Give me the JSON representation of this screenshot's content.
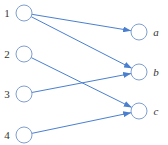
{
  "diagram": {
    "type": "bipartite-graph",
    "colors": {
      "edge": "#4a7fd0",
      "node_stroke": "#7f9fd0",
      "text": "#333333"
    },
    "left_nodes": [
      {
        "id": "1",
        "label": "1",
        "x": 24,
        "y": 13
      },
      {
        "id": "2",
        "label": "2",
        "x": 24,
        "y": 54
      },
      {
        "id": "3",
        "label": "3",
        "x": 24,
        "y": 94
      },
      {
        "id": "4",
        "label": "4",
        "x": 24,
        "y": 135
      }
    ],
    "right_nodes": [
      {
        "id": "a",
        "label": "a",
        "x": 139,
        "y": 32
      },
      {
        "id": "b",
        "label": "b",
        "x": 139,
        "y": 72
      },
      {
        "id": "c",
        "label": "c",
        "x": 139,
        "y": 111
      }
    ],
    "edges": [
      {
        "from": "1",
        "to": "a"
      },
      {
        "from": "1",
        "to": "b"
      },
      {
        "from": "2",
        "to": "c"
      },
      {
        "from": "3",
        "to": "b"
      },
      {
        "from": "4",
        "to": "c"
      }
    ]
  }
}
